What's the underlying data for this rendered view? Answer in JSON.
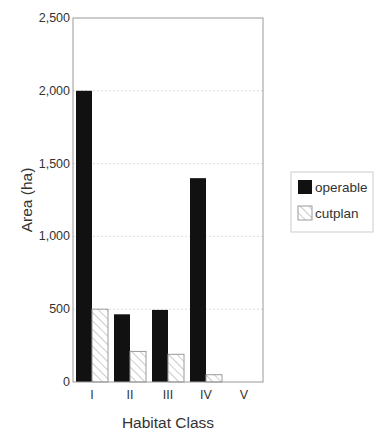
{
  "chart_data": {
    "type": "bar",
    "title": "",
    "xlabel": "Habitat Class",
    "ylabel": "Area (ha)",
    "categories": [
      "I",
      "II",
      "III",
      "IV",
      "V"
    ],
    "series": [
      {
        "name": "operable",
        "values": [
          2000,
          465,
          495,
          1400,
          0
        ],
        "fill": "#111111",
        "pattern": "solid"
      },
      {
        "name": "cutplan",
        "values": [
          500,
          210,
          190,
          50,
          0
        ],
        "fill": "#ffffff",
        "pattern": "hatch"
      }
    ],
    "ylim": [
      0,
      2500
    ],
    "yticks": [
      0,
      500,
      1000,
      1500,
      2000,
      2500
    ],
    "ytick_labels": [
      "0",
      "500",
      "1,000",
      "1,500",
      "2,000",
      "2,500"
    ],
    "grid": {
      "horizontal": true,
      "style": "dotted",
      "color": "#dddddd"
    },
    "legend": {
      "position": "right",
      "entries": [
        "operable",
        "cutplan"
      ]
    }
  },
  "colors": {
    "frame": "#9a9a9a",
    "operable": "#111111",
    "cutplan_stroke": "#9a9a9a",
    "hatch": "#b0b0b0"
  }
}
